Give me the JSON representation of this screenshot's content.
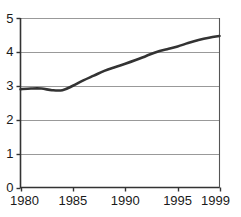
{
  "chart_data": {
    "type": "line",
    "title": "",
    "subtitle": "",
    "xlabel": "",
    "ylabel": "",
    "xlim": [
      1980,
      1999
    ],
    "ylim": [
      0,
      5
    ],
    "grid": true,
    "legend": null,
    "legend_position": "none",
    "line_color": "#333333",
    "axis_color": "#333333",
    "grid_color": "#999999",
    "background_color": "#ffffff",
    "x_ticks": [
      1980,
      1985,
      1990,
      1995,
      1999
    ],
    "x_tick_labels": [
      "1980",
      "1985",
      "1990",
      "1995",
      "1999"
    ],
    "y_ticks": [
      0,
      1,
      2,
      3,
      4,
      5
    ],
    "y_tick_labels": [
      "0",
      "1",
      "2",
      "3",
      "4",
      "5"
    ],
    "series": [
      {
        "name": "series-1",
        "x": [
          1980,
          1981,
          1982,
          1983,
          1984,
          1985,
          1986,
          1987,
          1988,
          1989,
          1990,
          1991,
          1992,
          1993,
          1994,
          1995,
          1996,
          1997,
          1998,
          1999
        ],
        "values": [
          2.9,
          2.92,
          2.92,
          2.87,
          2.87,
          3.0,
          3.16,
          3.3,
          3.44,
          3.55,
          3.65,
          3.76,
          3.88,
          4.0,
          4.08,
          4.16,
          4.26,
          4.35,
          4.42,
          4.47
        ]
      }
    ]
  }
}
